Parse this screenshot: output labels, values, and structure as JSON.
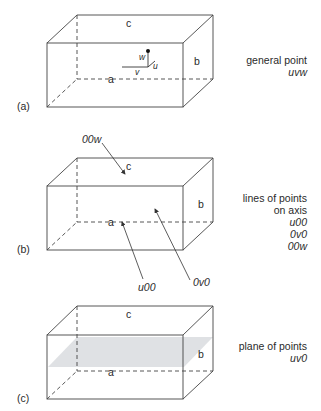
{
  "panels": [
    {
      "id": "a",
      "label": "(a)",
      "edges": {
        "c": "c",
        "a": "a",
        "b": "b"
      },
      "point_labels": {
        "w": "w",
        "u": "u",
        "v": "v"
      },
      "caption": [
        "general point"
      ],
      "caption_italic": [
        "uvw"
      ]
    },
    {
      "id": "b",
      "label": "(b)",
      "edges": {
        "c": "c",
        "a": "a",
        "b": "b"
      },
      "arrow_labels": {
        "top": "00w",
        "left": "u00",
        "right": "0v0"
      },
      "caption": [
        "lines of points",
        "on axis"
      ],
      "caption_italic": [
        "u00",
        "0v0",
        "00w"
      ]
    },
    {
      "id": "c",
      "label": "(c)",
      "edges": {
        "c": "c",
        "a": "a",
        "b": "b"
      },
      "caption": [
        "plane of points"
      ],
      "caption_italic": [
        "uv0"
      ]
    }
  ],
  "colors": {
    "line": "#444444",
    "plane": "#d9dcdf"
  }
}
